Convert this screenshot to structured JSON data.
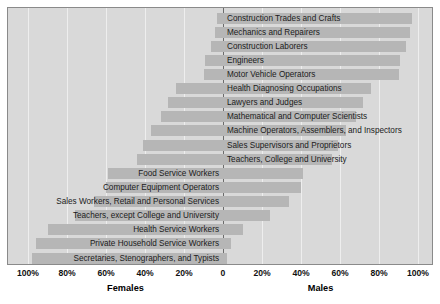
{
  "chart_data": {
    "type": "bar",
    "title": "",
    "subtitle": "",
    "orientation": "horizontal-diverging",
    "xlabel_left": "Females",
    "xlabel_right": "Males",
    "ylabel": "",
    "xlim": [
      -100,
      100
    ],
    "grid": true,
    "legend_position": "none",
    "tick_labels": [
      "100%",
      "80%",
      "60%",
      "40%",
      "20%",
      "0",
      "20%",
      "40%",
      "60%",
      "80%",
      "100%"
    ],
    "tick_values": [
      -100,
      -80,
      -60,
      -40,
      -20,
      0,
      20,
      40,
      60,
      80,
      100
    ],
    "categories": [
      "Construction Trades and Crafts",
      "Mechanics and Repairers",
      "Construction Laborers",
      "Engineers",
      "Motor Vehicle Operators",
      "Health Diagnosing Occupations",
      "Lawyers and Judges",
      "Mathematical and Computer Scientists",
      "Machine Operators, Assemblers, and Inspectors",
      "Sales Supervisors and Proprietors",
      "Teachers, College and University",
      "Food Service Workers",
      "Computer Equipment Operators",
      "Sales Workers, Retail and Personal Services",
      "Teachers, except College and University",
      "Health Service Workers",
      "Private Household Service Workers",
      "Secretaries, Stenographers, and Typists"
    ],
    "series": [
      {
        "name": "Males",
        "side": "right",
        "values": [
          97,
          96,
          94,
          91,
          90,
          76,
          72,
          68,
          63,
          59,
          56,
          41,
          40,
          34,
          24,
          10,
          4,
          2
        ]
      },
      {
        "name": "Females",
        "side": "left",
        "values": [
          3,
          4,
          6,
          9,
          10,
          24,
          28,
          32,
          37,
          41,
          44,
          59,
          60,
          66,
          76,
          90,
          96,
          98
        ]
      }
    ],
    "label_side": [
      "right",
      "right",
      "right",
      "right",
      "right",
      "right",
      "right",
      "right",
      "right",
      "right",
      "right",
      "left",
      "left",
      "left",
      "left",
      "left",
      "left",
      "left"
    ],
    "colors": {
      "bar_fill": "#b6b6b6",
      "plot_background": "#d9d9d9",
      "page_background": "#ffffff",
      "gridline": "#eeeeee",
      "zero_line": "#6b6b6b",
      "border": "#8a8a8a",
      "text": "#1b1b1b"
    }
  }
}
